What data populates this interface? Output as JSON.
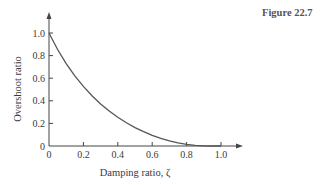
{
  "figure": {
    "label": "Figure 22.7"
  },
  "chart_data": {
    "type": "line",
    "title": "",
    "xlabel": "Damping ratio, ζ",
    "ylabel": "Overshoot ratio",
    "xlim": [
      0,
      1.1
    ],
    "ylim": [
      0,
      1.1
    ],
    "grid": false,
    "legend": null,
    "x_ticks": [
      "0",
      "0.2",
      "0.4",
      "0.6",
      "0.8",
      "1.0"
    ],
    "y_ticks": [
      "0",
      "0.2",
      "0.4",
      "0.6",
      "0.8",
      "1.0"
    ],
    "series": [
      {
        "name": "Overshoot ratio",
        "x": [
          0,
          0.05,
          0.1,
          0.15,
          0.2,
          0.25,
          0.3,
          0.35,
          0.4,
          0.45,
          0.5,
          0.55,
          0.6,
          0.65,
          0.7,
          0.75,
          0.8,
          0.85,
          0.9,
          0.95,
          1.0
        ],
        "values": [
          1.0,
          0.854,
          0.729,
          0.62,
          0.527,
          0.444,
          0.372,
          0.309,
          0.254,
          0.205,
          0.163,
          0.127,
          0.095,
          0.068,
          0.046,
          0.028,
          0.015,
          0.006,
          0.002,
          0.0,
          0.0
        ]
      }
    ],
    "color": "#555555"
  }
}
